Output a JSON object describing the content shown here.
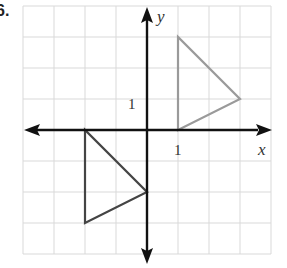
{
  "problem_label": "6.",
  "graph": {
    "x_axis_label": "x",
    "y_axis_label": "y",
    "x_tick_label": "1",
    "y_tick_label": "1",
    "grid": {
      "x_range": [
        -4,
        4
      ],
      "y_range": [
        -4,
        4
      ],
      "unit_px": 31
    },
    "colors": {
      "grid": "#d9d9d9",
      "axis": "#111111",
      "triangle_original": "#9a9a9a",
      "triangle_image": "#444444"
    },
    "triangles": [
      {
        "name": "original",
        "vertices": [
          [
            1,
            0
          ],
          [
            1,
            3
          ],
          [
            3,
            1
          ]
        ]
      },
      {
        "name": "image",
        "vertices": [
          [
            -2,
            0
          ],
          [
            -2,
            -3
          ],
          [
            0,
            -2
          ]
        ]
      }
    ]
  }
}
